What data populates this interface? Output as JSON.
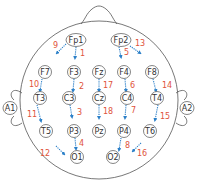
{
  "colors": {
    "outline": "#555555",
    "electrode_stroke": "#666666",
    "electrode_fill": "#ffffff",
    "arrow": "#2a7fc8",
    "number": "#e0533a",
    "text": "#333333"
  },
  "head": {
    "cx": 99,
    "cy": 100,
    "r": 79
  },
  "ears": [
    {
      "id": "A1",
      "label": "A1",
      "x": 10,
      "y": 108
    },
    {
      "id": "A2",
      "label": "A2",
      "x": 187,
      "y": 108
    }
  ],
  "electrodes": [
    {
      "id": "Fp1",
      "label": "Fp1",
      "x": 76,
      "y": 40,
      "wide": true
    },
    {
      "id": "Fp2",
      "label": "Fp2",
      "x": 121,
      "y": 40,
      "wide": true
    },
    {
      "id": "F7",
      "label": "F7",
      "x": 45,
      "y": 72
    },
    {
      "id": "F3",
      "label": "F3",
      "x": 74,
      "y": 72
    },
    {
      "id": "Fz",
      "label": "Fz",
      "x": 99,
      "y": 72
    },
    {
      "id": "F4",
      "label": "F4",
      "x": 124,
      "y": 72
    },
    {
      "id": "F8",
      "label": "F8",
      "x": 152,
      "y": 72
    },
    {
      "id": "T3",
      "label": "T3",
      "x": 40,
      "y": 98
    },
    {
      "id": "C3",
      "label": "C3",
      "x": 69,
      "y": 98
    },
    {
      "id": "Cz",
      "label": "Cz",
      "x": 99,
      "y": 98
    },
    {
      "id": "C4",
      "label": "C4",
      "x": 127,
      "y": 98
    },
    {
      "id": "T4",
      "label": "T4",
      "x": 157,
      "y": 98
    },
    {
      "id": "T5",
      "label": "T5",
      "x": 46,
      "y": 131
    },
    {
      "id": "P3",
      "label": "P3",
      "x": 74,
      "y": 131
    },
    {
      "id": "Pz",
      "label": "Pz",
      "x": 99,
      "y": 131
    },
    {
      "id": "P4",
      "label": "P4",
      "x": 124,
      "y": 131
    },
    {
      "id": "T6",
      "label": "T6",
      "x": 150,
      "y": 131
    },
    {
      "id": "O1",
      "label": "O1",
      "x": 77,
      "y": 157
    },
    {
      "id": "O2",
      "label": "O2",
      "x": 113,
      "y": 157
    }
  ],
  "channels": [
    {
      "num": "1",
      "from": "Fp1",
      "to": "F3",
      "x1": 76,
      "y1": 47,
      "x2": 75,
      "y2": 58,
      "nx": 80,
      "ny": 53
    },
    {
      "num": "2",
      "from": "F3",
      "to": "C3",
      "x1": 74,
      "y1": 79,
      "x2": 73,
      "y2": 91,
      "nx": 79,
      "ny": 86
    },
    {
      "num": "3",
      "from": "C3",
      "to": "P3",
      "x1": 70,
      "y1": 105,
      "x2": 72,
      "y2": 117,
      "nx": 77,
      "ny": 112
    },
    {
      "num": "4",
      "from": "P3",
      "to": "O1",
      "x1": 75,
      "y1": 138,
      "x2": 76,
      "y2": 149,
      "nx": 79,
      "ny": 143
    },
    {
      "num": "5",
      "from": "Fp2",
      "to": "F4",
      "x1": 119,
      "y1": 47,
      "x2": 121,
      "y2": 57,
      "nx": 124,
      "ny": 52
    },
    {
      "num": "6",
      "from": "F4",
      "to": "C4",
      "x1": 125,
      "y1": 79,
      "x2": 126,
      "y2": 91,
      "nx": 130,
      "ny": 85
    },
    {
      "num": "7",
      "from": "C4",
      "to": "P4",
      "x1": 126,
      "y1": 105,
      "x2": 125,
      "y2": 118,
      "nx": 131,
      "ny": 110
    },
    {
      "num": "8",
      "from": "P4",
      "to": "O2",
      "x1": 121,
      "y1": 138,
      "x2": 119,
      "y2": 150,
      "nx": 125,
      "ny": 145
    },
    {
      "num": "9",
      "from": "Fp1",
      "to": "F7",
      "x1": 66,
      "y1": 44,
      "x2": 57,
      "y2": 53,
      "nx": 53,
      "ny": 45
    },
    {
      "num": "10",
      "from": "F7",
      "to": "T3",
      "x1": 42,
      "y1": 79,
      "x2": 40,
      "y2": 91,
      "nx": 29,
      "ny": 84
    },
    {
      "num": "11",
      "from": "T3",
      "to": "T5",
      "x1": 37,
      "y1": 105,
      "x2": 41,
      "y2": 121,
      "nx": 27,
      "ny": 114
    },
    {
      "num": "12",
      "from": "T5",
      "to": "O1",
      "x1": 56,
      "y1": 146,
      "x2": 64,
      "y2": 154,
      "nx": 40,
      "ny": 153
    },
    {
      "num": "13",
      "from": "Fp2",
      "to": "F8",
      "x1": 130,
      "y1": 46,
      "x2": 140,
      "y2": 53,
      "nx": 135,
      "ny": 43
    },
    {
      "num": "14",
      "from": "F8",
      "to": "T4",
      "x1": 153,
      "y1": 79,
      "x2": 156,
      "y2": 91,
      "nx": 162,
      "ny": 85
    },
    {
      "num": "15",
      "from": "T4",
      "to": "T6",
      "x1": 158,
      "y1": 105,
      "x2": 155,
      "y2": 120,
      "nx": 160,
      "ny": 116
    },
    {
      "num": "16",
      "from": "T6",
      "to": "O2",
      "x1": 141,
      "y1": 143,
      "x2": 133,
      "y2": 151,
      "nx": 137,
      "ny": 153
    },
    {
      "num": "17",
      "from": "Fz",
      "to": "Cz",
      "x1": 99,
      "y1": 79,
      "x2": 99,
      "y2": 91,
      "nx": 103,
      "ny": 85
    },
    {
      "num": "18",
      "from": "Cz",
      "to": "Pz",
      "x1": 99,
      "y1": 105,
      "x2": 99,
      "y2": 118,
      "nx": 103,
      "ny": 111
    }
  ]
}
